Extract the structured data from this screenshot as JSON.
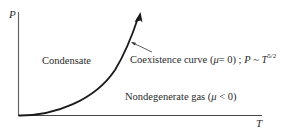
{
  "diagram": {
    "type": "phase-diagram",
    "axes": {
      "y_label": "P",
      "x_label": "T"
    },
    "regions": {
      "condensate": "Condensate",
      "gas": {
        "text": "Nondegenerate gas (",
        "mu": "μ",
        "condition": " < 0)"
      }
    },
    "curve": {
      "name_prefix": "Coexistence curve (",
      "mu": "μ",
      "eq": "= 0) ; ",
      "P": "P",
      "sim": " ~ ",
      "T": "T",
      "exponent": "5/2"
    },
    "colors": {
      "line": "#222222",
      "axis": "#555555",
      "background": "#ffffff"
    }
  }
}
